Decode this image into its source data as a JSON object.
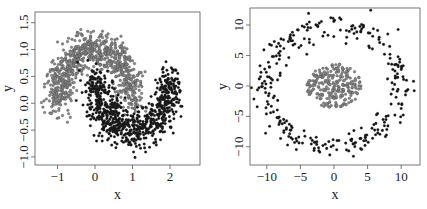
{
  "chart_data": [
    {
      "type": "scatter",
      "title": "",
      "xlabel": "x",
      "ylabel": "y",
      "xlim": [
        -1.6,
        2.8
      ],
      "ylim": [
        -1.15,
        1.7
      ],
      "xticks": [
        -1,
        0,
        1,
        2
      ],
      "xtick_labels": [
        "-1",
        "0",
        "1",
        "2"
      ],
      "yticks": [
        -1.0,
        -0.5,
        0.0,
        0.5,
        1.0,
        1.5
      ],
      "ytick_labels": [
        "-1.0",
        "-0.5",
        "0.0",
        "0.5",
        "1.0",
        "1.5"
      ],
      "grid": false,
      "legend": null,
      "description": "Two interleaving half-moons",
      "series": [
        {
          "name": "class-grey (upper moon)",
          "color": "#8a8a8a",
          "shape": "arc",
          "center": [
            0,
            0
          ],
          "radius": 1,
          "angle_range_deg": [
            0,
            180
          ],
          "noise": 0.18,
          "count": 800
        },
        {
          "name": "class-black (lower moon)",
          "color": "#111111",
          "shape": "arc",
          "center": [
            1,
            0.5
          ],
          "radius": 1,
          "angle_range_deg": [
            180,
            360
          ],
          "noise": 0.18,
          "count": 800
        }
      ]
    },
    {
      "type": "scatter",
      "title": "",
      "xlabel": "x",
      "ylabel": "y",
      "xlim": [
        -12.5,
        12.8
      ],
      "ylim": [
        -13,
        12.8
      ],
      "xticks": [
        -10,
        -5,
        0,
        5,
        10
      ],
      "xtick_labels": [
        "-10",
        "-5",
        "0",
        "5",
        "10"
      ],
      "yticks": [
        -10,
        -5,
        0,
        5,
        10
      ],
      "ytick_labels": [
        "-10",
        "-5",
        "0",
        "5",
        "10"
      ],
      "grid": false,
      "legend": null,
      "description": "Concentric circles: inner grey blob, outer black ring",
      "series": [
        {
          "name": "class-grey (inner cluster)",
          "color": "#8a8a8a",
          "shape": "disk",
          "center": [
            0,
            0
          ],
          "radius": 4.5,
          "count": 250
        },
        {
          "name": "class-black (outer ring)",
          "color": "#111111",
          "shape": "ring",
          "center": [
            0,
            0
          ],
          "radius": 10,
          "noise": 1.0,
          "count": 300
        }
      ]
    }
  ]
}
